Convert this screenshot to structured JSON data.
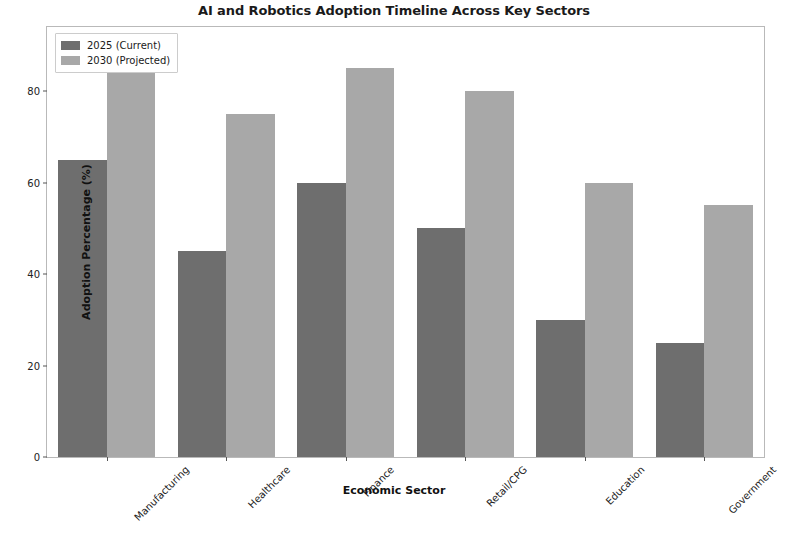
{
  "chart_data": {
    "type": "bar",
    "title": "AI and Robotics Adoption Timeline Across Key Sectors",
    "xlabel": "Economic Sector",
    "ylabel": "Adoption Percentage (%)",
    "categories": [
      "Manufacturing",
      "Healthcare",
      "Finance",
      "Retail/CPG",
      "Education",
      "Government"
    ],
    "series": [
      {
        "name": "2025 (Current)",
        "color": "#6e6e6e",
        "values": [
          65,
          45,
          60,
          50,
          30,
          25
        ]
      },
      {
        "name": "2030 (Projected)",
        "color": "#a8a8a8",
        "values": [
          90,
          75,
          85,
          80,
          60,
          55
        ]
      }
    ],
    "ylim": [
      0,
      94
    ],
    "yticks": [
      0,
      20,
      40,
      60,
      80
    ],
    "ytick_labels": [
      "0",
      "20",
      "40",
      "60",
      "80"
    ],
    "grid": false,
    "legend_position": "upper left",
    "xtick_rotation": -45
  },
  "figure": {
    "background_color": "#ffffff",
    "axes_edge_color": "#b9b9b9"
  }
}
